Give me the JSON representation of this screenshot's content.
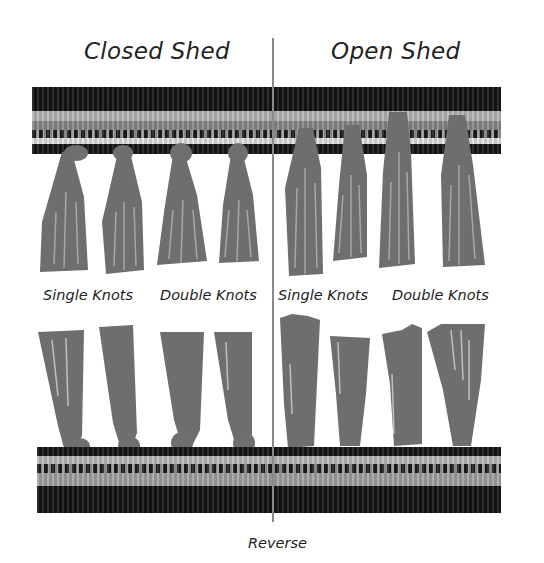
{
  "figure": {
    "titles": {
      "left": "Closed Shed",
      "right": "Open Shed"
    },
    "mid_labels": [
      "Single Knots",
      "Double Knots",
      "Single Knots",
      "Double Knots"
    ],
    "caption_bottom": "Reverse"
  },
  "colors": {
    "background": "#ffffff",
    "band_black": "#141414",
    "band_light": "#bdbdbd",
    "band_mid": "#7e7e7e",
    "band_white": "#e6e6e6",
    "tassel": "#6e6e6e",
    "divider": "#8a8a8a",
    "text": "#222222"
  }
}
